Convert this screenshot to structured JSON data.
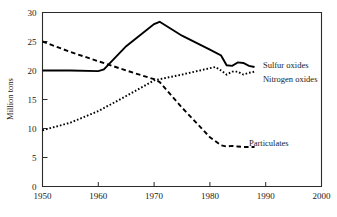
{
  "chart_data": {
    "type": "line",
    "title": "",
    "xlabel": "",
    "ylabel": "Million tons",
    "xlim": [
      1950,
      2000
    ],
    "ylim": [
      0,
      30
    ],
    "xticks": [
      "1950",
      "1960",
      "1970",
      "1980",
      "1990",
      "2000"
    ],
    "yticks": [
      "0",
      "5",
      "10",
      "15",
      "20",
      "25",
      "30"
    ],
    "grid": false,
    "legend_position": "inline-right",
    "series": [
      {
        "name": "Sulfur oxides",
        "style": "solid",
        "color": "#000000",
        "x": [
          1950,
          1955,
          1960,
          1961,
          1965,
          1970,
          1971,
          1975,
          1980,
          1982,
          1983,
          1984,
          1985,
          1986,
          1987,
          1988
        ],
        "values": [
          20.0,
          20.0,
          19.9,
          20.2,
          24.2,
          28.0,
          28.4,
          26.0,
          23.6,
          22.6,
          20.9,
          20.8,
          21.4,
          21.3,
          20.8,
          20.6
        ]
      },
      {
        "name": "Nitrogen oxides",
        "style": "dotted",
        "color": "#000000",
        "x": [
          1950,
          1955,
          1960,
          1965,
          1970,
          1971,
          1975,
          1980,
          1981,
          1982,
          1983,
          1984,
          1985,
          1986,
          1987,
          1988
        ],
        "values": [
          9.7,
          11.0,
          13.0,
          15.6,
          18.3,
          18.5,
          19.3,
          20.4,
          20.6,
          20.0,
          19.3,
          19.8,
          19.8,
          19.3,
          19.6,
          19.8
        ]
      },
      {
        "name": "Particulates",
        "style": "dashed",
        "color": "#000000",
        "x": [
          1950,
          1955,
          1960,
          1965,
          1970,
          1971,
          1975,
          1980,
          1982,
          1983,
          1984,
          1985,
          1986,
          1987,
          1988
        ],
        "values": [
          25.0,
          23.2,
          21.6,
          20.0,
          18.5,
          18.0,
          13.6,
          8.5,
          7.1,
          6.9,
          7.0,
          6.9,
          6.8,
          6.8,
          6.8
        ]
      }
    ],
    "annotations": [
      {
        "text": "Sulfur oxides",
        "x": 1989.5,
        "y": 20.9
      },
      {
        "text": "Nitrogen oxides",
        "x": 1989.5,
        "y": 18.6
      },
      {
        "text": "Particulates",
        "x": 1987.0,
        "y": 7.5
      }
    ]
  }
}
